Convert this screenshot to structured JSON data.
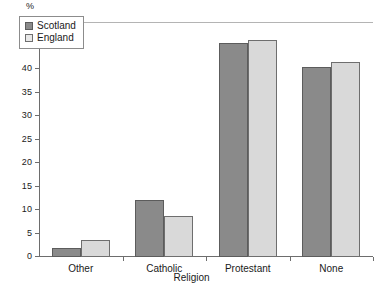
{
  "chart_data": {
    "type": "bar",
    "title": "",
    "xlabel": "Religion",
    "ylabel": "%",
    "categories": [
      "Other",
      "Catholic",
      "Protestant",
      "None"
    ],
    "series": [
      {
        "name": "Scotland",
        "color": "#8a8a8a",
        "values": [
          2.0,
          12.2,
          45.6,
          40.4
        ]
      },
      {
        "name": "England",
        "color": "#d9d9d9",
        "values": [
          3.7,
          8.8,
          46.2,
          41.4
        ]
      }
    ],
    "ylim": [
      0,
      50
    ],
    "ytick_labels": [
      "0",
      "5",
      "10",
      "15",
      "20",
      "25",
      "30",
      "35",
      "40",
      "45",
      "50"
    ],
    "ytick_values": [
      0,
      5,
      10,
      15,
      20,
      25,
      30,
      35,
      40,
      45,
      50
    ],
    "grid": false,
    "legend_position": "upper-left-inside"
  },
  "legend": {
    "entries": [
      {
        "label": "Scotland"
      },
      {
        "label": "England"
      }
    ]
  },
  "axes": {
    "y_unit_label": "%",
    "x_axis_title": "Religion"
  }
}
